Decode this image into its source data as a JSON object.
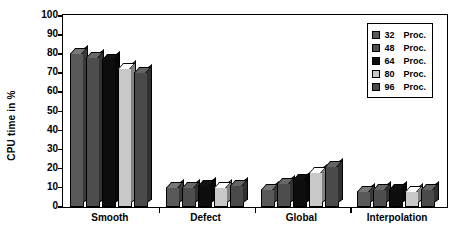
{
  "chart_data": {
    "type": "bar",
    "title": "",
    "xlabel": "",
    "ylabel": "CPU time in %",
    "ylim": [
      0,
      100
    ],
    "yticks": [
      0,
      10,
      20,
      30,
      40,
      50,
      60,
      70,
      80,
      90,
      100
    ],
    "grid": false,
    "legend_position": "top-right",
    "categories": [
      "Smooth",
      "Defect",
      "Global",
      "Interpolation"
    ],
    "series": [
      {
        "name": "32  Proc.",
        "count": "32",
        "unit": "Proc.",
        "color": "#595959",
        "values": [
          79,
          9,
          8,
          7
        ]
      },
      {
        "name": "48  Proc.",
        "count": "48",
        "unit": "Proc.",
        "color": "#4d4d4d",
        "values": [
          77,
          9,
          11,
          8
        ]
      },
      {
        "name": "64  Proc.",
        "count": "64",
        "unit": "Proc.",
        "color": "#0d0d0d",
        "values": [
          76,
          10,
          13,
          8
        ]
      },
      {
        "name": "80  Proc.",
        "count": "80",
        "unit": "Proc.",
        "color": "#c8c8c8",
        "values": [
          71,
          9,
          17,
          7
        ]
      },
      {
        "name": "96  Proc.",
        "count": "96",
        "unit": "Proc.",
        "color": "#4a4a4a",
        "values": [
          69,
          10,
          20,
          8
        ]
      }
    ]
  }
}
